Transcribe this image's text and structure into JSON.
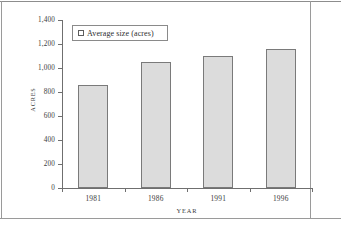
{
  "chart_data": {
    "type": "bar",
    "title": "",
    "categories": [
      "1981",
      "1986",
      "1991",
      "1996"
    ],
    "values": [
      860,
      1050,
      1100,
      1160
    ],
    "series": [
      {
        "name": "Average size (acres)",
        "values": [
          860,
          1050,
          1100,
          1160
        ]
      }
    ],
    "xlabel": "YEAR",
    "ylabel": "ACRES",
    "ylim": [
      0,
      1400
    ],
    "yticks": [
      0,
      200,
      400,
      600,
      800,
      1000,
      1200,
      1400
    ],
    "ytick_labels": [
      "0",
      "200",
      "400",
      "600",
      "800",
      "1,000",
      "1,200",
      "1,400"
    ],
    "grid": false,
    "legend_position": "upper-left",
    "bar_fill_color": "#dcdcdc",
    "bar_border_color": "#7a7a7a"
  },
  "legend": {
    "entries": [
      {
        "label": "Average size (acres)",
        "marker": "open-square"
      }
    ]
  },
  "axes": {
    "x_title": "YEAR",
    "y_title": "ACRES"
  }
}
